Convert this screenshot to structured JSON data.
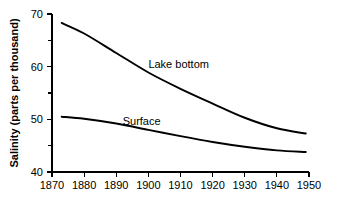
{
  "chart_data": {
    "type": "line",
    "title": "",
    "subtitle": "",
    "xlabel": "",
    "ylabel": "Salinity (parts per thousand)",
    "xlim": [
      1870,
      1950
    ],
    "ylim": [
      40,
      70
    ],
    "x_ticks": [
      1870,
      1880,
      1890,
      1900,
      1910,
      1920,
      1930,
      1940,
      1950
    ],
    "x_tick_labels": [
      "1870",
      "1880",
      "1890",
      "1900",
      "1910",
      "1920",
      "1930",
      "1940",
      "1950"
    ],
    "y_ticks": [
      40,
      50,
      60,
      70
    ],
    "y_tick_labels": [
      "40",
      "50",
      "60",
      "70"
    ],
    "y_minor_ticks": [
      45,
      55,
      65
    ],
    "grid": false,
    "legend": "inline-annotations",
    "x": [
      1873,
      1880,
      1890,
      1900,
      1910,
      1920,
      1930,
      1940,
      1949
    ],
    "series": [
      {
        "name": "Lake bottom",
        "label": "Lake bottom",
        "color": "#000000",
        "values": [
          68.3,
          66.3,
          62.6,
          58.9,
          55.8,
          53.0,
          50.3,
          48.3,
          47.3
        ],
        "annotation": {
          "text": "Lake bottom",
          "x": 1900,
          "y": 59.8
        }
      },
      {
        "name": "Surface",
        "label": "Surface",
        "color": "#000000",
        "values": [
          50.5,
          50.1,
          49.2,
          48.0,
          46.8,
          45.7,
          44.8,
          44.1,
          43.8
        ],
        "annotation": {
          "text": "Surface",
          "x": 1892,
          "y": 48.9
        }
      }
    ]
  }
}
